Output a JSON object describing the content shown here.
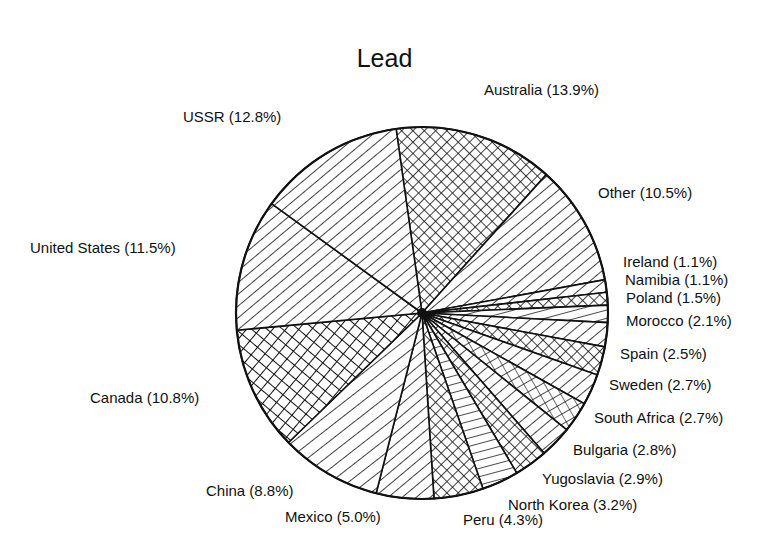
{
  "chart_data": {
    "type": "pie",
    "title": "Lead",
    "slices": [
      {
        "label": "Australia",
        "value": 13.9,
        "text": "Australia (13.9%)",
        "pattern": "cross-diag",
        "lx": 484,
        "ly": 90
      },
      {
        "label": "Other",
        "value": 10.5,
        "text": "Other (10.5%)",
        "pattern": "diag-right",
        "lx": 598,
        "ly": 193
      },
      {
        "label": "Ireland",
        "value": 1.1,
        "text": "Ireland (1.1%)",
        "pattern": "diag-right",
        "lx": 623,
        "ly": 262
      },
      {
        "label": "Namibia",
        "value": 1.1,
        "text": "Namibia (1.1%)",
        "pattern": "cross-diag",
        "lx": 625,
        "ly": 280
      },
      {
        "label": "Poland",
        "value": 1.5,
        "text": "Poland (1.5%)",
        "pattern": "horizontal",
        "lx": 626,
        "ly": 298
      },
      {
        "label": "Morocco",
        "value": 2.1,
        "text": "Morocco (2.1%)",
        "pattern": "diag-right",
        "lx": 626,
        "ly": 321
      },
      {
        "label": "Spain",
        "value": 2.5,
        "text": "Spain (2.5%)",
        "pattern": "cross-diag",
        "lx": 620,
        "ly": 354
      },
      {
        "label": "Sweden",
        "value": 2.7,
        "text": "Sweden (2.7%)",
        "pattern": "diag-right",
        "lx": 609,
        "ly": 385
      },
      {
        "label": "South Africa",
        "value": 2.7,
        "text": "South Africa (2.7%)",
        "pattern": "grid-diag",
        "lx": 594,
        "ly": 418
      },
      {
        "label": "Bulgaria",
        "value": 2.8,
        "text": "Bulgaria (2.8%)",
        "pattern": "diag-right",
        "lx": 573,
        "ly": 450
      },
      {
        "label": "Yugoslavia",
        "value": 2.9,
        "text": "Yugoslavia (2.9%)",
        "pattern": "cross-diag",
        "lx": 542,
        "ly": 479
      },
      {
        "label": "North Korea",
        "value": 3.2,
        "text": "North Korea (3.2%)",
        "pattern": "horizontal",
        "lx": 508,
        "ly": 505
      },
      {
        "label": "Peru",
        "value": 4.3,
        "text": "Peru (4.3%)",
        "pattern": "cross-diag",
        "lx": 463,
        "ly": 520
      },
      {
        "label": "Mexico",
        "value": 5.0,
        "text": "Mexico (5.0%)",
        "pattern": "diag-right",
        "lx": 285,
        "ly": 517
      },
      {
        "label": "China",
        "value": 8.8,
        "text": "China (8.8%)",
        "pattern": "diag-right-wide",
        "lx": 206,
        "ly": 491
      },
      {
        "label": "Canada",
        "value": 10.8,
        "text": "Canada (10.8%)",
        "pattern": "cross-square",
        "lx": 90,
        "ly": 398
      },
      {
        "label": "United States",
        "value": 11.5,
        "text": "United States (11.5%)",
        "pattern": "diag-right",
        "lx": 30,
        "ly": 248
      },
      {
        "label": "USSR",
        "value": 12.8,
        "text": "USSR (12.8%)",
        "pattern": "diag-right",
        "lx": 183,
        "ly": 117
      }
    ],
    "center": [
      422,
      313
    ],
    "radius": 186,
    "start_angle_deg": -98,
    "legend": "none"
  }
}
